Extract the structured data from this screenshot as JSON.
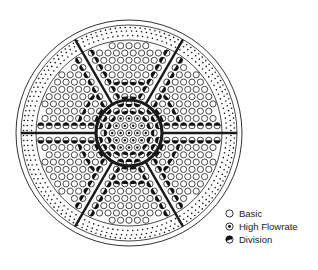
{
  "diagram": {
    "center": [
      129,
      133
    ],
    "colors": {
      "stroke": "#1a1a1a",
      "fill_dark": "#111111",
      "background": "#ffffff"
    },
    "rings": {
      "outer_radius": 113,
      "second_radius": 108,
      "inner_boundary_radius": 93,
      "core_radius": 33,
      "core_stroke_width": 3.2
    },
    "spokes": {
      "count": 6,
      "angles_deg": [
        0,
        60,
        120,
        180,
        240,
        300
      ],
      "inner_radius": 33,
      "outer_radius": 108,
      "stroke_width": 2.4
    },
    "dotted_band": {
      "rows": [
        97.5,
        102,
        105.5
      ],
      "dot_radius": 0.8,
      "spacing": 5
    },
    "lattice": {
      "spacing": 8.4,
      "row_height": 7.27,
      "circle_radius": 3.1,
      "min_r": 0,
      "max_r": 89,
      "core_clear_inner": 30.5,
      "core_clear_outer": 36
    }
  },
  "legend": {
    "items": [
      {
        "key": "basic",
        "label": "Basic"
      },
      {
        "key": "high_flowrate",
        "label": "High Flowrate"
      },
      {
        "key": "division",
        "label": "Division"
      }
    ]
  }
}
